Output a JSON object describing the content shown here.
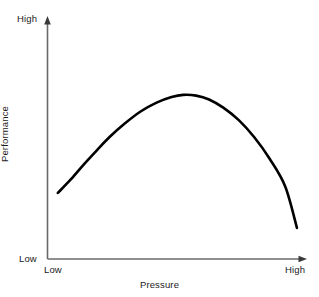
{
  "chart_data": {
    "type": "line",
    "title": "",
    "subtitle": "",
    "xlabel": "Pressure",
    "ylabel": "Performance",
    "xlim": [
      0,
      1
    ],
    "ylim": [
      0,
      1
    ],
    "grid": false,
    "legend": null,
    "x_tick_labels": [
      "Low",
      "High"
    ],
    "y_tick_labels": [
      "Low",
      "High"
    ],
    "annotations": [],
    "series": [
      {
        "name": "Performance",
        "color": "#000000",
        "x": [
          0.04,
          0.09,
          0.14,
          0.19,
          0.24,
          0.3,
          0.36,
          0.42,
          0.48,
          0.525,
          0.575,
          0.625,
          0.68,
          0.74,
          0.8,
          0.86,
          0.92,
          0.965
        ],
        "y": [
          0.274,
          0.33,
          0.392,
          0.45,
          0.506,
          0.563,
          0.612,
          0.648,
          0.672,
          0.681,
          0.678,
          0.662,
          0.628,
          0.576,
          0.505,
          0.415,
          0.3,
          0.129
        ],
        "peak": {
          "x": 0.525,
          "y": 0.681
        }
      }
    ]
  },
  "axes": {
    "y_high_label": "High",
    "y_low_label": "Low",
    "x_low_label": "Low",
    "x_high_label": "High",
    "x_title": "Pressure",
    "y_title": "Performance"
  },
  "colors": {
    "background": "#ffffff",
    "axis": "#6a6a6a",
    "curve": "#000000",
    "text": "#1a1a1a"
  }
}
